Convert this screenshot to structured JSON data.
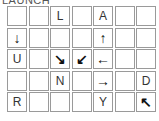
{
  "title": "LAUNCH",
  "grid": {
    "rows": 5,
    "cols": 7,
    "cells": [
      [
        "",
        "",
        "L",
        "",
        "A",
        "",
        ""
      ],
      [
        "↓",
        "",
        "",
        "",
        "↑",
        "",
        ""
      ],
      [
        "U",
        "",
        "↘",
        "↙",
        "←",
        "",
        ""
      ],
      [
        "",
        "",
        "N",
        "",
        "→",
        "",
        "D"
      ],
      [
        "R",
        "",
        "",
        "",
        "Y",
        "",
        "↖"
      ]
    ]
  }
}
